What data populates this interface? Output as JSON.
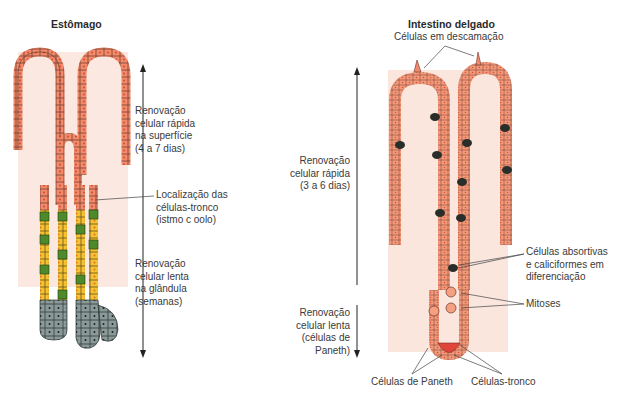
{
  "stomach": {
    "title": "Estômago",
    "labels": {
      "fast_renewal": [
        "Renovação",
        "celular rápida",
        "na superfície",
        "(4 a 7 dias)"
      ],
      "stem_location": [
        "Localização das",
        "células-tronco",
        "(istmo c oolo)"
      ],
      "slow_renewal": [
        "Renovação",
        "celular lenta",
        "na glândula",
        "(semanas)"
      ]
    }
  },
  "intestine": {
    "title": "Intestino delgado",
    "labels": {
      "shedding": "Células em descamação",
      "fast_renewal": [
        "Renovação",
        "celular rápida",
        "(3 a 6 dias)"
      ],
      "slow_renewal": [
        "Renovação",
        "celular lenta",
        "(células de",
        "Paneth)"
      ],
      "differentiating": [
        "Células absortivas",
        "e caliciformes em",
        "diferenciação"
      ],
      "mitoses": "Mitoses",
      "paneth": "Células de Paneth",
      "stem": "Células-tronco"
    }
  },
  "colors": {
    "epithelium": "#f08a6a",
    "cell_outline": "#5a3028",
    "lamina": "#fbe4dc",
    "stem_green": "#4e8a2c",
    "chief_yellow": "#f2c230",
    "neck_gray": "#8a9a98",
    "goblet": "#2a2e2a",
    "paneth": "#e0453a",
    "arrow": "#222222"
  }
}
